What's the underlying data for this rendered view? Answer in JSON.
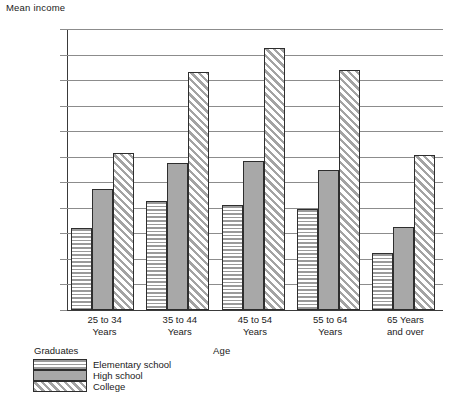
{
  "chart_data": {
    "type": "bar",
    "title": "",
    "ylabel": "Mean income",
    "xlabel": "Age",
    "ylim": [
      0,
      22000
    ],
    "ytick_step": 2000,
    "grid": true,
    "legend_position": "bottom-left",
    "legend_title": "Graduates",
    "categories": [
      "25 to 34 Years",
      "35 to 44 Years",
      "45 to 54 Years",
      "55 to 64 Years",
      "65 Years and over"
    ],
    "series": [
      {
        "name": "Elementary school",
        "pattern": "horizontal-stripes",
        "values": [
          6400,
          8500,
          8200,
          7900,
          4500
        ]
      },
      {
        "name": "High school",
        "pattern": "solid-gray",
        "values": [
          9500,
          11500,
          11700,
          11000,
          6500
        ]
      },
      {
        "name": "College",
        "pattern": "diagonal-hatch",
        "values": [
          12300,
          18600,
          20500,
          18800,
          12100
        ]
      }
    ]
  },
  "axes": {
    "y_title": "Mean income",
    "x_title": "Age",
    "y_ticks": [
      "$22,000",
      "20,000",
      "18,000",
      "16,000",
      "14,000",
      "12,000",
      "10,000",
      "8,000",
      "6,000",
      "4,000",
      "2,000",
      "0"
    ],
    "x_ticks": [
      {
        "line1": "25 to 34",
        "line2": "Years"
      },
      {
        "line1": "35 to 44",
        "line2": "Years"
      },
      {
        "line1": "45 to 54",
        "line2": "Years"
      },
      {
        "line1": "55 to 64",
        "line2": "Years"
      },
      {
        "line1": "65 Years",
        "line2": "and over"
      }
    ]
  },
  "legend": {
    "title": "Graduates",
    "items": [
      {
        "label": "Elementary school"
      },
      {
        "label": "High school"
      },
      {
        "label": "College"
      }
    ]
  },
  "colors": {
    "grid": "#8c8c8c",
    "axis": "#3a3a3a",
    "bar_fill_gray": "#a8a8a8",
    "pattern_gray": "#9a9a9a",
    "background": "#ffffff",
    "text": "#1a1a1a"
  }
}
